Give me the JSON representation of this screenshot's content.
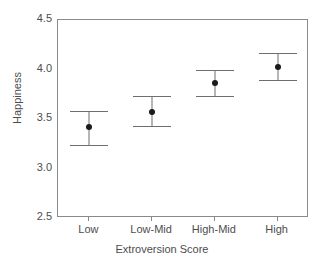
{
  "chart_data": {
    "type": "scatter",
    "title": "",
    "xlabel": "Extroversion Score",
    "ylabel": "Happiness",
    "categories": [
      "Low",
      "Low-Mid",
      "High-Mid",
      "High"
    ],
    "values": [
      3.42,
      3.57,
      3.86,
      4.03
    ],
    "error_upper": [
      3.58,
      3.73,
      4.0,
      4.17
    ],
    "error_lower": [
      3.24,
      3.43,
      3.73,
      3.89
    ],
    "ylim": [
      2.5,
      4.5
    ],
    "ytick_labels": [
      "4.5",
      "4.0",
      "3.5",
      "3.0",
      "2.5"
    ],
    "ytick_values": [
      4.5,
      4.0,
      3.5,
      3.0,
      2.5
    ],
    "grid": false,
    "legend": "none",
    "marker": "filled-circle",
    "errorbar_style": "capped",
    "colors": {
      "marker": "#1a1a1a",
      "errorbar": "#6f6f6f",
      "axis": "#8a8a8a",
      "text": "#4d4d4d",
      "background": "#ffffff"
    }
  },
  "axis": {
    "y_title": "Happiness",
    "x_title": "Extroversion Score"
  }
}
